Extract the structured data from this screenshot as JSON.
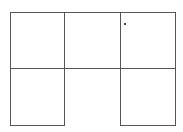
{
  "diagram": {
    "type": "grid-outline",
    "line_color": "#555555",
    "columns_x": [
      10,
      64,
      120,
      175
    ],
    "rows_y": [
      12,
      68,
      125
    ],
    "cells": [
      {
        "row": 0,
        "col": 0,
        "closed": true
      },
      {
        "row": 0,
        "col": 1,
        "closed": true
      },
      {
        "row": 0,
        "col": 2,
        "closed": true
      },
      {
        "row": 1,
        "col": 0,
        "closed": true
      },
      {
        "row": 1,
        "col": 1,
        "closed": false,
        "note": "open bottom"
      },
      {
        "row": 1,
        "col": 2,
        "closed": true
      }
    ],
    "marker": {
      "x": 124,
      "y": 23
    }
  }
}
